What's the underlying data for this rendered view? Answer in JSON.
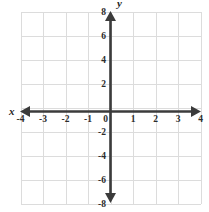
{
  "figure": {
    "title": "",
    "background_color": "#ffffff",
    "axis_color": "#3b3b3b",
    "grid_color": "#dcdcdc",
    "label_color": "#2b2b2b"
  },
  "axis_names": {
    "x": "x",
    "y": "y"
  },
  "chart_data": {
    "type": "scatter",
    "title": "",
    "xlabel": "x",
    "ylabel": "y",
    "xlim": [
      -4,
      4
    ],
    "ylim": [
      -8,
      8
    ],
    "grid": true,
    "legend": "none",
    "x_tick_labels": [
      "-4",
      "-3",
      "-2",
      "-1",
      "0",
      "1",
      "2",
      "3",
      "4"
    ],
    "x_tick_values": [
      -4,
      -3,
      -2,
      -1,
      0,
      1,
      2,
      3,
      4
    ],
    "y_tick_labels": [
      "8",
      "6",
      "4",
      "2",
      "-2",
      "-4",
      "-6",
      "-8"
    ],
    "y_tick_values": [
      8,
      6,
      4,
      2,
      -2,
      -4,
      -6,
      -8
    ],
    "x_grid_step": 1,
    "y_grid_step": 2,
    "origin_label": "0",
    "series": [],
    "annotations": []
  }
}
